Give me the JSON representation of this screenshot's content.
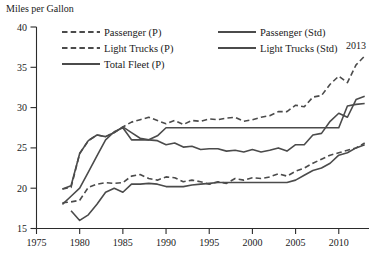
{
  "chart_data": {
    "type": "line",
    "title": "",
    "ylabel": "Miles per Gallon",
    "xlabel": "",
    "xlim": [
      1975,
      2013.5
    ],
    "ylim": [
      15,
      40
    ],
    "yticks": [
      15,
      20,
      25,
      30,
      35,
      40
    ],
    "xticks": [
      1975,
      1980,
      1985,
      1990,
      1995,
      2000,
      2005,
      2010
    ],
    "grid": false,
    "legend_position": "top",
    "annotations": [
      {
        "text": "2013",
        "x": 2012.0,
        "y": 37.3
      }
    ],
    "series": [
      {
        "name": "Passenger (P)",
        "style": "dashed",
        "x": [
          1978,
          1979,
          1980,
          1981,
          1982,
          1983,
          1984,
          1985,
          1986,
          1987,
          1988,
          1989,
          1990,
          1991,
          1992,
          1993,
          1994,
          1995,
          1996,
          1997,
          1998,
          1999,
          2000,
          2001,
          2002,
          2003,
          2004,
          2005,
          2006,
          2007,
          2008,
          2009,
          2010,
          2011,
          2012,
          2013
        ],
        "values": [
          19.9,
          20.1,
          24.3,
          25.9,
          26.6,
          26.4,
          26.9,
          27.6,
          28.2,
          28.5,
          28.8,
          28.4,
          28.0,
          28.4,
          27.9,
          28.4,
          28.3,
          28.6,
          28.5,
          28.7,
          28.8,
          28.3,
          28.5,
          28.8,
          29.0,
          29.5,
          29.5,
          30.3,
          30.1,
          31.3,
          31.5,
          32.9,
          33.9,
          33.1,
          35.3,
          36.4
        ]
      },
      {
        "name": "Light Trucks (P)",
        "style": "dashed",
        "x": [
          1978,
          1979,
          1980,
          1981,
          1982,
          1983,
          1984,
          1985,
          1986,
          1987,
          1988,
          1989,
          1990,
          1991,
          1992,
          1993,
          1994,
          1995,
          1996,
          1997,
          1998,
          1999,
          2000,
          2001,
          2002,
          2003,
          2004,
          2005,
          2006,
          2007,
          2008,
          2009,
          2010,
          2011,
          2012,
          2013
        ],
        "values": [
          18.2,
          18.3,
          18.5,
          20.1,
          20.5,
          20.7,
          20.6,
          20.7,
          21.5,
          21.7,
          21.2,
          21.0,
          21.4,
          21.3,
          20.8,
          21.0,
          20.8,
          20.5,
          20.8,
          20.6,
          21.2,
          21.0,
          21.3,
          21.2,
          21.4,
          21.8,
          21.5,
          22.1,
          22.5,
          23.1,
          23.6,
          24.1,
          24.4,
          24.7,
          25.0,
          25.6
        ]
      },
      {
        "name": "Total Fleet (P)",
        "style": "solid",
        "x": [
          1978,
          1979,
          1980,
          1981,
          1982,
          1983,
          1984,
          1985,
          1986,
          1987,
          1988,
          1989,
          1990,
          1991,
          1992,
          1993,
          1994,
          1995,
          1996,
          1997,
          1998,
          1999,
          2000,
          2001,
          2002,
          2003,
          2004,
          2005,
          2006,
          2007,
          2008,
          2009,
          2010,
          2011,
          2012,
          2013
        ],
        "values": [
          19.9,
          20.3,
          24.3,
          25.9,
          26.6,
          26.4,
          26.9,
          27.6,
          26.9,
          26.2,
          26.0,
          25.9,
          25.4,
          25.6,
          25.1,
          25.2,
          24.8,
          24.9,
          24.9,
          24.6,
          24.7,
          24.5,
          24.8,
          24.5,
          24.7,
          25.0,
          24.6,
          25.4,
          25.4,
          26.6,
          26.8,
          28.3,
          29.3,
          28.8,
          31.0,
          31.4
        ]
      },
      {
        "name": "Passenger (Std)",
        "style": "solid",
        "x": [
          1978,
          1979,
          1980,
          1981,
          1982,
          1983,
          1984,
          1985,
          1986,
          1987,
          1988,
          1989,
          1990,
          2010,
          2011,
          2012,
          2013
        ],
        "values": [
          18.0,
          19.0,
          20.0,
          22.0,
          24.0,
          26.0,
          27.0,
          27.5,
          26.0,
          26.0,
          26.0,
          26.5,
          27.5,
          27.5,
          30.2,
          30.4,
          30.5
        ]
      },
      {
        "name": "Light Trucks (Std)",
        "style": "solid",
        "x": [
          1979,
          1980,
          1981,
          1982,
          1983,
          1984,
          1985,
          1986,
          1987,
          1988,
          1989,
          1990,
          1991,
          1992,
          1993,
          1994,
          1995,
          1996,
          1997,
          1998,
          1999,
          2000,
          2001,
          2002,
          2003,
          2004,
          2005,
          2006,
          2007,
          2008,
          2009,
          2010,
          2011,
          2012,
          2013
        ],
        "values": [
          17.2,
          16.0,
          16.7,
          18.0,
          19.5,
          20.0,
          19.5,
          20.5,
          20.5,
          20.6,
          20.5,
          20.2,
          20.2,
          20.2,
          20.4,
          20.5,
          20.6,
          20.7,
          20.7,
          20.7,
          20.7,
          20.7,
          20.7,
          20.7,
          20.7,
          20.7,
          21.0,
          21.6,
          22.2,
          22.5,
          23.1,
          24.1,
          24.4,
          25.0,
          25.4
        ]
      }
    ],
    "legend": [
      {
        "label": "Passenger (P)",
        "style": "dashed",
        "column": 0
      },
      {
        "label": "Light Trucks (P)",
        "style": "dashed",
        "column": 0
      },
      {
        "label": "Total Fleet (P)",
        "style": "solid",
        "column": 0
      },
      {
        "label": "Passenger (Std)",
        "style": "solid",
        "column": 1
      },
      {
        "label": "Light Trucks (Std)",
        "style": "solid",
        "column": 1
      }
    ]
  }
}
